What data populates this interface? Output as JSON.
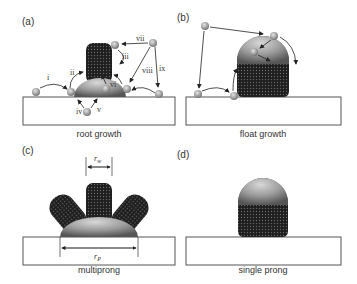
{
  "figure": {
    "panels": [
      {
        "id": "a",
        "label": "(a)",
        "caption": "root growth",
        "steps": [
          "i",
          "ii",
          "iii",
          "iv",
          "v",
          "vi",
          "vii",
          "viii",
          "ix"
        ]
      },
      {
        "id": "b",
        "label": "(b)",
        "caption": "float growth"
      },
      {
        "id": "c",
        "label": "(c)",
        "caption": "multiprong",
        "dimensions": {
          "wire_radius": "r",
          "wire_sub": "w",
          "particle_radius": "r",
          "particle_sub": "P"
        }
      },
      {
        "id": "d",
        "label": "(d)",
        "caption": "single prong"
      }
    ],
    "colors": {
      "substrate_fill": "#ffffff",
      "substrate_stroke": "#555555",
      "dome": "#9a9a9a",
      "wire": "#2a2a2a",
      "adatom": "#a8a8a8"
    }
  }
}
